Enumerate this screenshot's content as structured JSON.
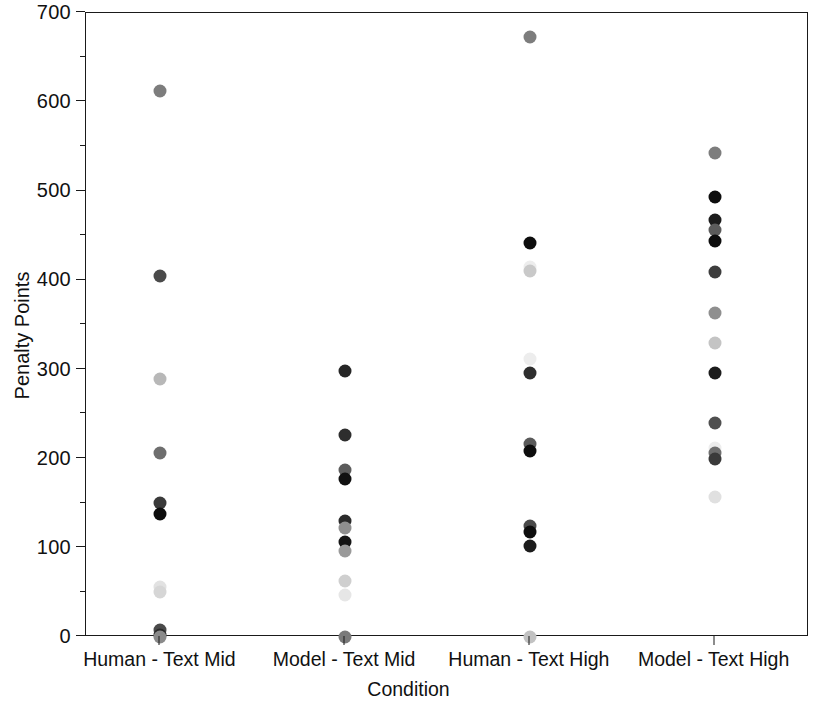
{
  "chart_data": {
    "type": "scatter",
    "title": "",
    "xlabel": "Condition",
    "ylabel": "Penalty Points",
    "ylim": [
      0,
      700
    ],
    "ytick_values": [
      0,
      100,
      200,
      300,
      400,
      500,
      600,
      700
    ],
    "ytick_labels": [
      "0",
      "100",
      "200",
      "300",
      "400",
      "500",
      "600",
      "700"
    ],
    "yminor_values": [
      50,
      150,
      250,
      350,
      450,
      550,
      650
    ],
    "grid": false,
    "legend": "none",
    "categories": [
      "Human - Text Mid",
      "Model - Text Mid",
      "Human - Text High",
      "Model - Text High"
    ],
    "series": [
      {
        "name": "Human - Text Mid",
        "category_index": 0,
        "points": [
          {
            "value": 613,
            "color": "#7d7d7d"
          },
          {
            "value": 405,
            "color": "#4a4a4a"
          },
          {
            "value": 289,
            "color": "#b8b8b8"
          },
          {
            "value": 206,
            "color": "#6e6e6e"
          },
          {
            "value": 150,
            "color": "#3a3a3a"
          },
          {
            "value": 138,
            "color": "#0d0d0d"
          },
          {
            "value": 56,
            "color": "#e2e2e2"
          },
          {
            "value": 50,
            "color": "#d6d6d6"
          },
          {
            "value": 8,
            "color": "#4a4a4a"
          },
          {
            "value": 2,
            "color": "#2b2b2b"
          },
          {
            "value": 0,
            "color": "#8a8a8a"
          }
        ]
      },
      {
        "name": "Model - Text Mid",
        "category_index": 1,
        "points": [
          {
            "value": 298,
            "color": "#262626"
          },
          {
            "value": 227,
            "color": "#2e2e2e"
          },
          {
            "value": 187,
            "color": "#5c5c5c"
          },
          {
            "value": 177,
            "color": "#111111"
          },
          {
            "value": 130,
            "color": "#2b2b2b"
          },
          {
            "value": 122,
            "color": "#8f8f8f"
          },
          {
            "value": 107,
            "color": "#151515"
          },
          {
            "value": 97,
            "color": "#9a9a9a"
          },
          {
            "value": 63,
            "color": "#cfcfcf"
          },
          {
            "value": 47,
            "color": "#e6e6e6"
          },
          {
            "value": 0,
            "color": "#7a7a7a"
          }
        ]
      },
      {
        "name": "Human - Text High",
        "category_index": 2,
        "points": [
          {
            "value": 673,
            "color": "#7d7d7d"
          },
          {
            "value": 442,
            "color": "#0d0d0d"
          },
          {
            "value": 415,
            "color": "#ededed"
          },
          {
            "value": 411,
            "color": "#c9c9c9"
          },
          {
            "value": 312,
            "color": "#ededed"
          },
          {
            "value": 296,
            "color": "#2e2e2e"
          },
          {
            "value": 216,
            "color": "#5a5a5a"
          },
          {
            "value": 209,
            "color": "#0d0d0d"
          },
          {
            "value": 125,
            "color": "#4a4a4a"
          },
          {
            "value": 118,
            "color": "#0d0d0d"
          },
          {
            "value": 102,
            "color": "#1c1c1c"
          },
          {
            "value": 0,
            "color": "#c2c2c2"
          }
        ]
      },
      {
        "name": "Model - Text High",
        "category_index": 3,
        "points": [
          {
            "value": 543,
            "color": "#7d7d7d"
          },
          {
            "value": 494,
            "color": "#0d0d0d"
          },
          {
            "value": 468,
            "color": "#1c1c1c"
          },
          {
            "value": 457,
            "color": "#5c5c5c"
          },
          {
            "value": 444,
            "color": "#0d0d0d"
          },
          {
            "value": 410,
            "color": "#3d3d3d"
          },
          {
            "value": 363,
            "color": "#8f8f8f"
          },
          {
            "value": 330,
            "color": "#c4c4c4"
          },
          {
            "value": 296,
            "color": "#1c1c1c"
          },
          {
            "value": 240,
            "color": "#4f4f4f"
          },
          {
            "value": 212,
            "color": "#ededed"
          },
          {
            "value": 206,
            "color": "#6e6e6e"
          },
          {
            "value": 200,
            "color": "#3a3a3a"
          },
          {
            "value": 157,
            "color": "#e0e0e0"
          }
        ]
      }
    ]
  }
}
